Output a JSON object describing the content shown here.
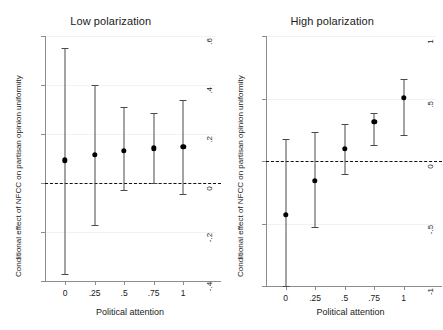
{
  "figure": {
    "ylabel": "Conditional effect of NFCC on partisan opinion uniformity",
    "xlabel": "Political attention"
  },
  "chart_data": [
    {
      "type": "scatter",
      "title": "Low polarization",
      "xlabel": "Political attention",
      "ylabel": "Conditional effect of NFCC on partisan opinion uniformity",
      "x": [
        0,
        0.25,
        0.5,
        0.75,
        1
      ],
      "xtick_labels": [
        "0",
        ".25",
        ".5",
        ".75",
        "1"
      ],
      "ytick_labels": [
        ".6",
        ".4",
        ".2",
        "0",
        "-.2",
        "-.4"
      ],
      "yticks": [
        0.6,
        0.4,
        0.2,
        0,
        -0.2,
        -0.4
      ],
      "ylim": [
        -0.4,
        0.6
      ],
      "xlim": [
        -0.17,
        1.27
      ],
      "values": [
        0.093,
        0.114,
        0.132,
        0.141,
        0.148
      ],
      "ci_low": [
        -0.37,
        -0.17,
        -0.03,
        0.0,
        -0.045
      ],
      "ci_high": [
        0.55,
        0.4,
        0.31,
        0.285,
        0.34
      ],
      "reference_line": 0,
      "grid": true,
      "legend": "none"
    },
    {
      "type": "scatter",
      "title": "High polarization",
      "xlabel": "Political attention",
      "ylabel": "Conditional effect of NFCC on partisan opinion uniformity",
      "x": [
        0,
        0.25,
        0.5,
        0.75,
        1
      ],
      "xtick_labels": [
        "0",
        ".25",
        ".5",
        ".75",
        "1"
      ],
      "ytick_labels": [
        "1",
        ".5",
        "0",
        "-.5",
        "-1"
      ],
      "yticks": [
        1,
        0.5,
        0,
        -0.5,
        -1
      ],
      "ylim": [
        -1,
        1
      ],
      "xlim": [
        -0.17,
        1.27
      ],
      "values": [
        -0.43,
        -0.158,
        0.1,
        0.316,
        0.508
      ],
      "ci_low": [
        -1.0,
        -0.53,
        -0.1,
        0.125,
        0.21
      ],
      "ci_high": [
        0.175,
        0.235,
        0.295,
        0.385,
        0.655
      ],
      "reference_line": 0,
      "grid": true,
      "legend": "none"
    }
  ]
}
